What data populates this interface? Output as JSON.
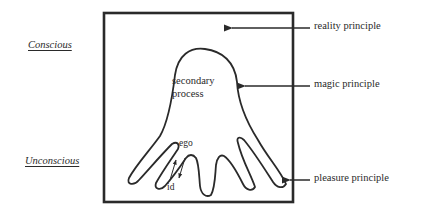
{
  "diagram": {
    "side_labels": {
      "conscious": "Conscious",
      "unconscious": "Unconscious"
    },
    "arrow_labels": {
      "reality": "reality principle",
      "magic": "magic principle",
      "pleasure": "pleasure principle"
    },
    "inner_labels": {
      "secondary_line1": "secondary",
      "secondary_line2": "process",
      "ego": "ego",
      "id": "id"
    },
    "colors": {
      "line": "#2a2a2a",
      "background": "#ffffff"
    }
  }
}
